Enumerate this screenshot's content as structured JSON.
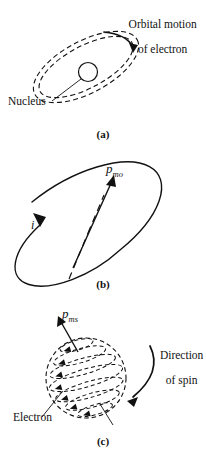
{
  "figure": {
    "ink_color": "#111111",
    "background": "#ffffff"
  },
  "panels": [
    {
      "id": "a",
      "caption": "(a)",
      "description": "Electron orbiting a nucleus along a dashed elliptical orbit",
      "labels": {
        "heading_line1": "Orbital motion",
        "heading_line2": "of electron",
        "nucleus": "Nucleus"
      },
      "elements": {
        "orbit_style": "double-dashed-ellipse",
        "nucleus_shape": "open-circle",
        "arrow": "curved-arrow-clockwise"
      }
    },
    {
      "id": "b",
      "caption": "(b)",
      "description": "Current loop with orbital magnetic moment vector",
      "labels": {
        "moment_symbol": "p",
        "moment_subscript": "mo",
        "current_symbol": "i"
      },
      "elements": {
        "loop_style": "solid-ellipse",
        "axis_style": "dashed-line",
        "arrow": "straight-vector-up-right"
      }
    },
    {
      "id": "c",
      "caption": "(c)",
      "description": "Spinning electron sphere with spin magnetic moment vector",
      "labels": {
        "moment_symbol": "p",
        "moment_subscript": "ms",
        "electron": "Electron",
        "spin_line1": "Direction",
        "spin_line2": "of spin"
      },
      "elements": {
        "sphere_style": "dashed-latitude-bands",
        "band_count": 7,
        "arrow": "straight-vector-up-left",
        "spin_arrow": "curved-arrow-down-left"
      }
    }
  ]
}
